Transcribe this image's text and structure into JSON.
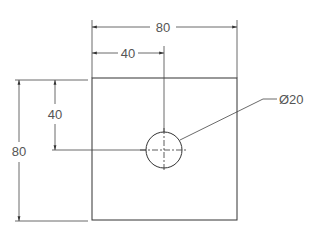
{
  "drawing": {
    "type": "engineering drawing",
    "part": {
      "shape": "square plate",
      "width": 80,
      "height": 80,
      "hole": {
        "diameter": 20,
        "center_x_from_left": 40,
        "center_y_from_top": 40
      }
    },
    "dimensions": {
      "overall_width": "80",
      "hole_x": "40",
      "hole_y": "40",
      "overall_height": "80",
      "hole_diameter": "Ø20"
    },
    "colors": {
      "line": "#333333",
      "text": "#555555",
      "background": "#ffffff"
    }
  }
}
